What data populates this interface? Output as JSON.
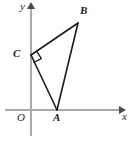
{
  "figure": {
    "type": "geometry-diagram",
    "background_color": "#ffffff",
    "axis_color": "#a9a9a9",
    "triangle_color": "#1c1c1c",
    "label_color": "#1c1c1c"
  },
  "axes": {
    "x_label": "x",
    "y_label": "y",
    "origin_label": "O",
    "x_axis": {
      "start_x": 5,
      "end_x": 121,
      "y": 110
    },
    "y_axis": {
      "x": 31,
      "start_y": 6,
      "end_y": 136
    },
    "grid": false,
    "tick_labels": []
  },
  "points": [
    {
      "name": "A",
      "label": "A",
      "x": 57,
      "y": 110,
      "label_x": 54,
      "label_y": 113,
      "on_axis": "x-axis"
    },
    {
      "name": "B",
      "label": "B",
      "x": 78,
      "y": 23,
      "label_x": 80,
      "label_y": 7,
      "on_axis": ""
    },
    {
      "name": "C",
      "label": "C",
      "x": 31,
      "y": 55,
      "label_x": 13,
      "label_y": 49,
      "on_axis": "y-axis"
    }
  ],
  "segments": [
    {
      "name": "CB",
      "from": "C",
      "to": "B"
    },
    {
      "name": "CA",
      "from": "C",
      "to": "A"
    },
    {
      "name": "AB",
      "from": "A",
      "to": "B"
    }
  ],
  "right_angle": {
    "at_vertex": "C",
    "marker": "square",
    "size": 8
  }
}
